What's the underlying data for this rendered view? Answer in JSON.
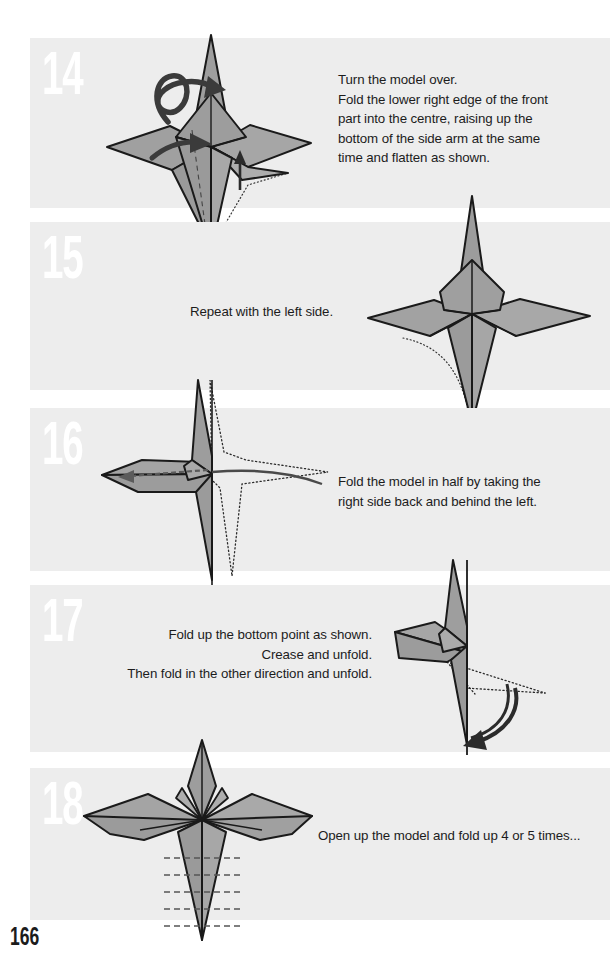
{
  "page": {
    "number": "166",
    "background_color": "#ffffff",
    "band_color": "#ededed",
    "text_color": "#1c1c1c",
    "step_number_color": "#ffffff",
    "paper_front_color": "#9a9a9a",
    "paper_back_color": "#b5b5b5",
    "line_color": "#1a1a1a",
    "arrow_color": "#4a4a4a"
  },
  "steps": [
    {
      "number": "14",
      "caption": "Turn the model over.\nFold the lower right edge of the front\npart into the centre, raising up the\nbottom of the side arm at the same\ntime and flatten as shown.",
      "caption_align": "left",
      "diagram_side": "left",
      "annotations": [
        "turn-over-loop-arrow",
        "push-in-arrow",
        "raise-up-arrow",
        "dotted-hidden-edge",
        "dashed-fold-line"
      ]
    },
    {
      "number": "15",
      "caption": "Repeat with the left side.",
      "caption_align": "left",
      "diagram_side": "right",
      "annotations": [
        "dotted-hidden-edge"
      ]
    },
    {
      "number": "16",
      "caption": "Fold the model in half by taking the\nright side back and behind the left.",
      "caption_align": "left",
      "diagram_side": "left",
      "annotations": [
        "dotted-outline-of-folded-part",
        "fold-behind-curved-arrow",
        "dashed-return-arrow"
      ]
    },
    {
      "number": "17",
      "caption": "Fold up the bottom point as shown.\nCrease and unfold.\nThen fold in the other direction and unfold.",
      "caption_align": "right",
      "diagram_side": "right",
      "annotations": [
        "dotted-crease-lines",
        "curved-double-fold-arrow"
      ]
    },
    {
      "number": "18",
      "caption": "Open up the model and fold up 4 or 5 times...",
      "caption_align": "left",
      "diagram_side": "left",
      "annotations": [
        "dashed-crease-lines-x5"
      ]
    }
  ]
}
